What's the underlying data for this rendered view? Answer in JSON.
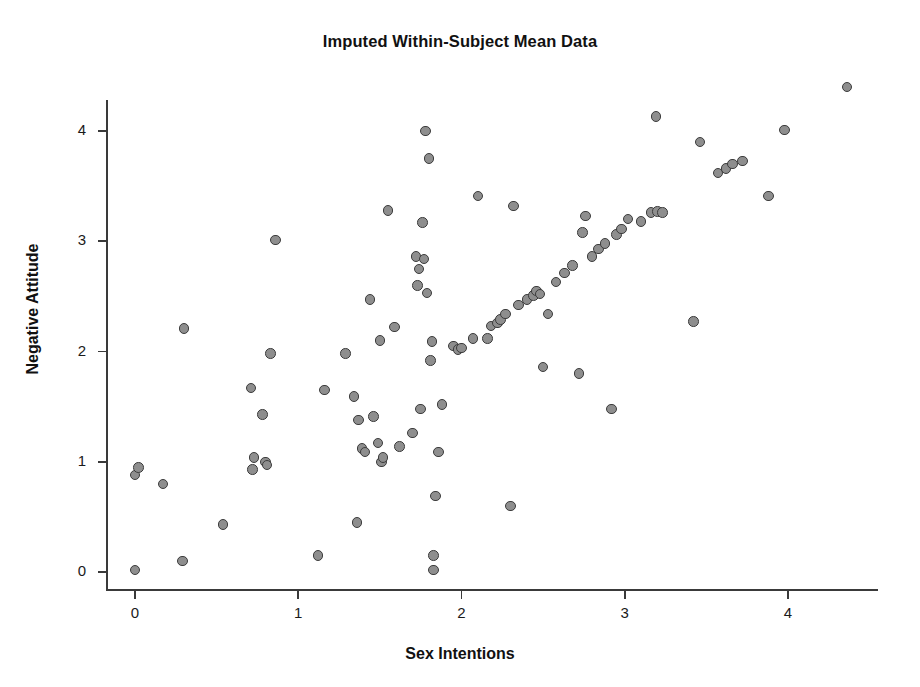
{
  "chart_data": {
    "type": "scatter",
    "title": "Imputed Within-Subject Mean Data",
    "xlabel": "Sex Intentions",
    "ylabel": "Negative Attitude",
    "xlim": [
      -0.18,
      4.62
    ],
    "ylim": [
      -0.22,
      4.62
    ],
    "xticks": [
      0,
      1,
      2,
      3,
      4
    ],
    "yticks": [
      0,
      1,
      2,
      3,
      4
    ],
    "xtick_labels": [
      "0",
      "1",
      "2",
      "3",
      "4"
    ],
    "ytick_labels": [
      "0",
      "1",
      "2",
      "3",
      "4"
    ],
    "grid": false,
    "legend": null,
    "marker": {
      "shape": "circle",
      "fill_color": "#8e8e8e",
      "edge_color": "#3c3c3c",
      "size_px": 10.5
    },
    "series": [
      {
        "name": "Imputed within-subject means",
        "points": [
          [
            0.0,
            0.02
          ],
          [
            0.0,
            0.88
          ],
          [
            0.02,
            0.95
          ],
          [
            0.17,
            0.8
          ],
          [
            0.29,
            0.1
          ],
          [
            0.3,
            2.21
          ],
          [
            0.54,
            0.43
          ],
          [
            0.71,
            1.67
          ],
          [
            0.72,
            0.93
          ],
          [
            0.73,
            1.04
          ],
          [
            0.78,
            1.43
          ],
          [
            0.8,
            1.0
          ],
          [
            0.81,
            0.97
          ],
          [
            0.83,
            1.98
          ],
          [
            0.86,
            3.01
          ],
          [
            1.12,
            0.15
          ],
          [
            1.16,
            1.65
          ],
          [
            1.29,
            1.98
          ],
          [
            1.34,
            1.59
          ],
          [
            1.36,
            0.45
          ],
          [
            1.37,
            1.38
          ],
          [
            1.39,
            1.12
          ],
          [
            1.41,
            1.09
          ],
          [
            1.44,
            2.47
          ],
          [
            1.46,
            1.41
          ],
          [
            1.49,
            1.17
          ],
          [
            1.5,
            2.1
          ],
          [
            1.51,
            1.0
          ],
          [
            1.52,
            1.04
          ],
          [
            1.55,
            3.28
          ],
          [
            1.59,
            2.22
          ],
          [
            1.62,
            1.14
          ],
          [
            1.7,
            1.26
          ],
          [
            1.72,
            2.86
          ],
          [
            1.73,
            2.6
          ],
          [
            1.74,
            2.75
          ],
          [
            1.75,
            1.48
          ],
          [
            1.76,
            3.17
          ],
          [
            1.77,
            2.84
          ],
          [
            1.78,
            4.0
          ],
          [
            1.79,
            2.53
          ],
          [
            1.8,
            3.75
          ],
          [
            1.81,
            1.92
          ],
          [
            1.82,
            2.09
          ],
          [
            1.83,
            0.15
          ],
          [
            1.83,
            0.02
          ],
          [
            1.84,
            0.69
          ],
          [
            1.86,
            1.09
          ],
          [
            1.88,
            1.52
          ],
          [
            1.95,
            2.05
          ],
          [
            1.98,
            2.02
          ],
          [
            2.0,
            2.03
          ],
          [
            2.07,
            2.12
          ],
          [
            2.1,
            3.41
          ],
          [
            2.16,
            2.12
          ],
          [
            2.18,
            2.23
          ],
          [
            2.22,
            2.26
          ],
          [
            2.24,
            2.29
          ],
          [
            2.27,
            2.34
          ],
          [
            2.3,
            0.6
          ],
          [
            2.32,
            3.32
          ],
          [
            2.35,
            2.42
          ],
          [
            2.4,
            2.47
          ],
          [
            2.44,
            2.51
          ],
          [
            2.46,
            2.55
          ],
          [
            2.48,
            2.52
          ],
          [
            2.5,
            1.86
          ],
          [
            2.53,
            2.34
          ],
          [
            2.58,
            2.63
          ],
          [
            2.63,
            2.71
          ],
          [
            2.68,
            2.78
          ],
          [
            2.72,
            1.8
          ],
          [
            2.74,
            3.08
          ],
          [
            2.76,
            3.23
          ],
          [
            2.8,
            2.86
          ],
          [
            2.84,
            2.93
          ],
          [
            2.88,
            2.98
          ],
          [
            2.92,
            1.48
          ],
          [
            2.95,
            3.06
          ],
          [
            2.98,
            3.11
          ],
          [
            3.02,
            3.2
          ],
          [
            3.1,
            3.18
          ],
          [
            3.16,
            3.26
          ],
          [
            3.19,
            4.13
          ],
          [
            3.2,
            3.27
          ],
          [
            3.23,
            3.26
          ],
          [
            3.42,
            2.27
          ],
          [
            3.46,
            3.9
          ],
          [
            3.57,
            3.62
          ],
          [
            3.62,
            3.66
          ],
          [
            3.66,
            3.7
          ],
          [
            3.72,
            3.73
          ],
          [
            3.88,
            3.41
          ],
          [
            3.98,
            4.01
          ],
          [
            4.36,
            4.4
          ]
        ]
      }
    ]
  }
}
